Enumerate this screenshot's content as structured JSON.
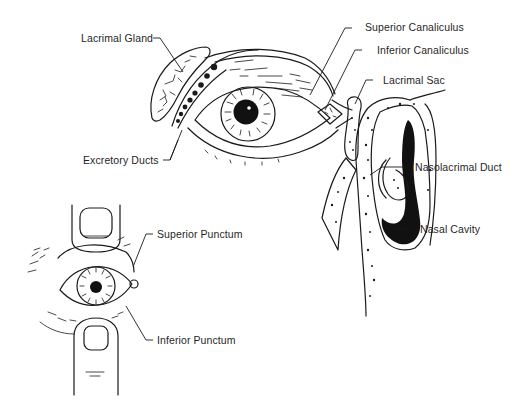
{
  "diagram": {
    "background": "#ffffff",
    "ink_color": "#1a1a1a",
    "panels": [
      {
        "id": "eye-lateral-nasal-section",
        "description": "Eye with lacrimal gland, canaliculi, lacrimal sac and cross-section of nasal cavity"
      },
      {
        "id": "eyelid-eversion-fingers",
        "description": "Eye held open by two fingers showing puncta"
      }
    ],
    "labels": {
      "lacrimal_gland": "Lacrimal Gland",
      "excretory_ducts": "Excretory Ducts",
      "superior_canaliculus": "Superior Canaliculus",
      "inferior_canaliculus": "Inferior Canaliculus",
      "lacrimal_sac": "Lacrimal Sac",
      "nasolacrimal_duct": "Nasolacrimal Duct",
      "nasal_cavity": "Nasal Cavity",
      "superior_punctum": "Superior Punctum",
      "inferior_punctum": "Inferior Punctum"
    }
  }
}
